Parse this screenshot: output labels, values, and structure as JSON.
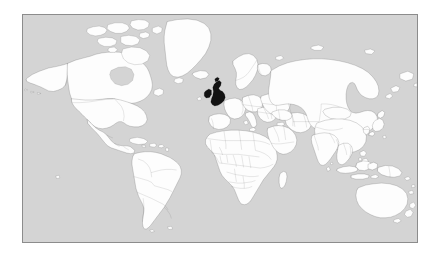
{
  "figure": {
    "kind": "world-locator-map",
    "projection": "rectangular",
    "frame": {
      "x": 22,
      "y": 14,
      "width": 396,
      "height": 229,
      "border_color": "#8c8c8c",
      "border_width": 1
    },
    "page_background": "#ffffff"
  },
  "colors": {
    "ocean": "#d4d4d4",
    "land_fill": "#fdfdfd",
    "coastline": "#2b2b2b",
    "country_border": "#4a4a4a",
    "highlight_fill": "#121212",
    "frame": "#8c8c8c"
  },
  "legend": {
    "visible": false,
    "items": []
  },
  "labels": {
    "visible": false,
    "text": []
  },
  "highlight": {
    "name": "United Kingdom",
    "color": "#121212",
    "approx_position": {
      "x": 211,
      "y": 93
    }
  },
  "regions": [
    {
      "name": "North America",
      "highlighted": false
    },
    {
      "name": "Greenland",
      "highlighted": false
    },
    {
      "name": "South America",
      "highlighted": false
    },
    {
      "name": "Europe",
      "highlighted": false
    },
    {
      "name": "Africa",
      "highlighted": false
    },
    {
      "name": "Asia",
      "highlighted": false
    },
    {
      "name": "Australia",
      "highlighted": false
    },
    {
      "name": "Antarctica",
      "highlighted": false
    }
  ]
}
